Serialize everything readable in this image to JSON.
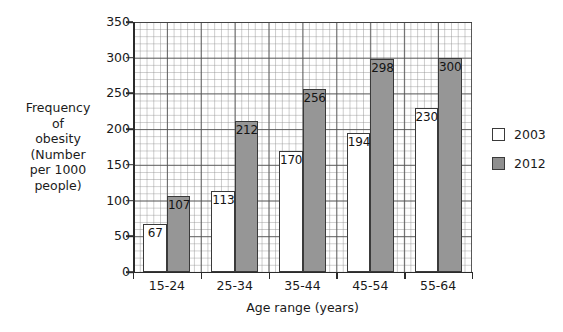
{
  "chart_data": {
    "type": "bar",
    "title": "",
    "xlabel": "Age range (years)",
    "ylabel": "Frequency of obesity (Number per 1000 people)",
    "categories": [
      "15-24",
      "25-34",
      "35-44",
      "45-54",
      "55-64"
    ],
    "series": [
      {
        "name": "2003",
        "color": "#ffffff",
        "values": [
          67,
          113,
          170,
          194,
          230
        ]
      },
      {
        "name": "2012",
        "color": "#969696",
        "values": [
          107,
          212,
          256,
          298,
          300
        ]
      }
    ],
    "ylim": [
      0,
      350
    ],
    "yticks": [
      0,
      50,
      100,
      150,
      200,
      250,
      300,
      350
    ],
    "ytick_labels": [
      "0",
      "50",
      "100",
      "150",
      "200",
      "250",
      "300",
      "350"
    ],
    "grid": true,
    "grid_minor": true,
    "legend_position": "right",
    "data_labels": true
  },
  "axis": {
    "y_title_lines": [
      "Frequency",
      "of",
      "obesity",
      "(Number",
      "per 1000",
      "people)"
    ],
    "x_title": "Age range (years)"
  },
  "legend": {
    "entries": [
      {
        "label": "2003",
        "color": "#ffffff"
      },
      {
        "label": "2012",
        "color": "#8f8f8f"
      }
    ]
  }
}
